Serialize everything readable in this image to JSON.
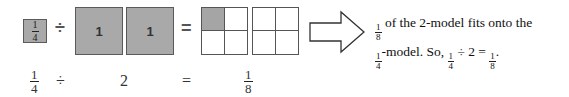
{
  "top_row": {
    "dividend_box": {
      "numerator": "1",
      "denominator": "4",
      "fill": "#a9a9a9"
    },
    "divide_symbol": "÷",
    "divisor_boxes": [
      {
        "label": "1"
      },
      {
        "label": "1"
      }
    ],
    "equals_symbol": "=",
    "result_grids": [
      {
        "cells": [
          true,
          false,
          false,
          false
        ]
      },
      {
        "cells": [
          false,
          false,
          false,
          false
        ]
      }
    ],
    "arrow": "right-arrow"
  },
  "explanation": {
    "line1_frac": {
      "numerator": "1",
      "denominator": "8"
    },
    "line1_text": "of the 2-model fits onto the",
    "line2_frac": {
      "numerator": "1",
      "denominator": "4"
    },
    "line2_text_a": "-model. So,",
    "line2_frac2": {
      "numerator": "1",
      "denominator": "4"
    },
    "line2_text_b": "÷ 2 =",
    "line2_frac3": {
      "numerator": "1",
      "denominator": "8"
    },
    "line2_end": "."
  },
  "bottom_row": {
    "dividend": {
      "numerator": "1",
      "denominator": "4"
    },
    "divide_symbol": "÷",
    "divisor": "2",
    "equals_symbol": "=",
    "result": {
      "numerator": "1",
      "denominator": "8"
    }
  }
}
